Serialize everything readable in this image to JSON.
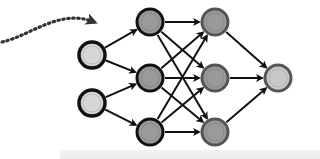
{
  "diagram": {
    "type": "neural-network",
    "colors": {
      "background": "#ffffff",
      "input_fill": "#d6d6d6",
      "hidden_fill": "#9a9a9a",
      "output_fill": "#c8c8c8",
      "stroke_dark": "#111111",
      "stroke_gray": "#555555",
      "arrow": "#111111",
      "dotted_arrow": "#333333"
    },
    "layers": [
      {
        "name": "input",
        "nodes": [
          {
            "id": "i1",
            "x": 92,
            "y": 55
          },
          {
            "id": "i2",
            "x": 92,
            "y": 103
          }
        ]
      },
      {
        "name": "hidden-1",
        "nodes": [
          {
            "id": "h1",
            "x": 150,
            "y": 22
          },
          {
            "id": "h2",
            "x": 150,
            "y": 78
          },
          {
            "id": "h3",
            "x": 150,
            "y": 132
          }
        ]
      },
      {
        "name": "hidden-2",
        "nodes": [
          {
            "id": "g1",
            "x": 215,
            "y": 22
          },
          {
            "id": "g2",
            "x": 215,
            "y": 78
          },
          {
            "id": "g3",
            "x": 215,
            "y": 132
          }
        ]
      },
      {
        "name": "output",
        "nodes": [
          {
            "id": "o1",
            "x": 278,
            "y": 78
          }
        ]
      }
    ],
    "incoming_arrow": {
      "style": "dotted",
      "from": [
        0,
        42
      ],
      "to": [
        96,
        22
      ]
    }
  }
}
